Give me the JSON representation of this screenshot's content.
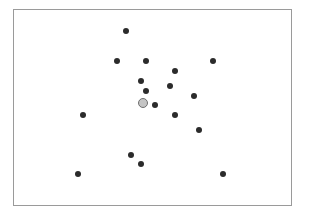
{
  "chart_data": {
    "type": "scatter",
    "title": "",
    "xlabel": "",
    "ylabel": "",
    "grid": false,
    "frame": {
      "left": 13,
      "top": 9,
      "right": 293,
      "bottom": 207
    },
    "points": [
      {
        "x": 126,
        "y": 31
      },
      {
        "x": 117,
        "y": 61
      },
      {
        "x": 146,
        "y": 61
      },
      {
        "x": 213,
        "y": 61
      },
      {
        "x": 175,
        "y": 71
      },
      {
        "x": 141,
        "y": 81
      },
      {
        "x": 170,
        "y": 86
      },
      {
        "x": 146,
        "y": 91
      },
      {
        "x": 194,
        "y": 96
      },
      {
        "x": 155,
        "y": 105
      },
      {
        "x": 83,
        "y": 115
      },
      {
        "x": 175,
        "y": 115
      },
      {
        "x": 199,
        "y": 130
      },
      {
        "x": 131,
        "y": 155
      },
      {
        "x": 141,
        "y": 164
      },
      {
        "x": 78,
        "y": 174
      },
      {
        "x": 223,
        "y": 174
      }
    ],
    "highlighted_point": {
      "x": 143,
      "y": 103,
      "color": "#c4c4c4"
    },
    "point_color": "#2b2b2b"
  }
}
